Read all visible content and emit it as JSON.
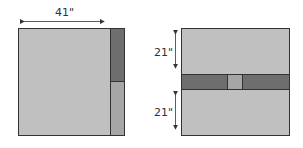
{
  "colors": {
    "light": "#c0c0c0",
    "dark": "#6e6e6e",
    "mid": "#a6a6a6",
    "stroke": "#333333"
  },
  "left_panel": {
    "width_label": "41\"",
    "description": "Square quilt block with narrow side strip split into dark top and medium bottom"
  },
  "right_panel": {
    "top_label": "21\"",
    "bottom_label": "21\"",
    "description": "Square quilt block with dark horizontal band and small light square in center"
  }
}
